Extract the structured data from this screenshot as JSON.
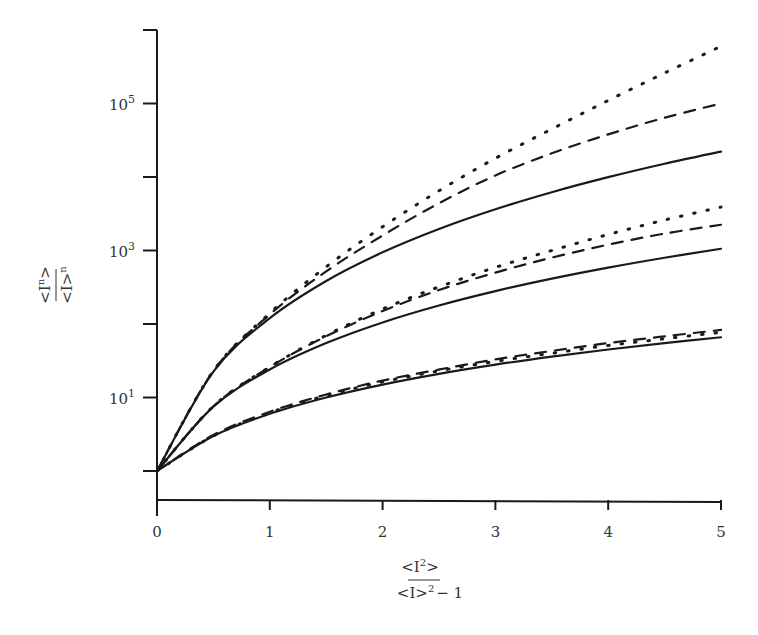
{
  "chart_data": {
    "type": "line",
    "title": "",
    "xlabel": "<I^2>/<I>^2 - 1",
    "xlabel_parts": {
      "numerator": "<I",
      "numerator_sup": "2",
      "numerator_end": ">",
      "denominator": "<I>",
      "denominator_sup": "2",
      "suffix": "− 1"
    },
    "ylabel": "<I^n>/<I>^n",
    "ylabel_parts": {
      "numerator": "<I",
      "numerator_sup": "n",
      "numerator_end": ">",
      "denominator": "<I>",
      "denominator_sup": "n"
    },
    "xlim": [
      0,
      5
    ],
    "ylim": [
      1,
      1000000
    ],
    "yscale": "log",
    "grid": false,
    "legend": null,
    "x_ticks": [
      0,
      1,
      2,
      3,
      4,
      5
    ],
    "x_tick_labels": [
      "0",
      "1",
      "2",
      "3",
      "4",
      "5"
    ],
    "y_ticks": [
      1,
      10,
      100,
      1000,
      10000,
      100000,
      1000000
    ],
    "y_tick_labels": [
      {
        "value": 10,
        "base": "10",
        "exp": "1"
      },
      {
        "value": 1000,
        "base": "10",
        "exp": "3"
      },
      {
        "value": 100000,
        "base": "10",
        "exp": "5"
      }
    ],
    "x": [
      0,
      0.5,
      1,
      1.5,
      2,
      2.5,
      3,
      3.5,
      4,
      4.5,
      5
    ],
    "series": [
      {
        "name": "n=3 solid",
        "style": "solid",
        "values": [
          1,
          3,
          6,
          10,
          15,
          21,
          28,
          36,
          45,
          55,
          66
        ]
      },
      {
        "name": "n=3 dashed",
        "style": "dashed",
        "values": [
          1,
          3.1,
          6.4,
          11,
          17,
          24,
          33,
          43,
          55,
          68,
          83
        ]
      },
      {
        "name": "n=3 dotted",
        "style": "dotted",
        "values": [
          1,
          3,
          6.2,
          10.6,
          16.3,
          23,
          31,
          40,
          51,
          63,
          77
        ]
      },
      {
        "name": "n=4 solid",
        "style": "solid",
        "values": [
          1,
          7.5,
          24,
          55,
          105,
          178.5,
          280,
          414,
          585,
          797.5,
          1056
        ]
      },
      {
        "name": "n=4 dashed",
        "style": "dashed",
        "values": [
          1,
          7.6,
          26,
          68,
          150,
          290,
          500,
          800,
          1200,
          1700,
          2240
        ]
      },
      {
        "name": "n=4 dotted",
        "style": "dotted",
        "values": [
          1,
          7.6,
          26,
          70,
          160,
          320,
          590,
          1000,
          1650,
          2600,
          3890
        ]
      },
      {
        "name": "n=5 solid",
        "style": "solid",
        "values": [
          1,
          22.5,
          120,
          385,
          945,
          1963.5,
          3640,
          6210,
          9945,
          15152.5,
          22176
        ]
      },
      {
        "name": "n=5 dashed",
        "style": "dashed",
        "values": [
          1,
          23,
          135,
          520,
          1600,
          4400,
          10500,
          21000,
          38000,
          64000,
          100000
        ]
      },
      {
        "name": "n=5 dotted",
        "style": "dotted",
        "values": [
          1,
          23,
          140,
          600,
          2100,
          6500,
          18000,
          45000,
          110000,
          260000,
          600000
        ]
      }
    ]
  },
  "colors": {
    "line": "#1a1a1a",
    "axis": "#1a1a1a",
    "text": "#333333",
    "background": "#ffffff"
  }
}
